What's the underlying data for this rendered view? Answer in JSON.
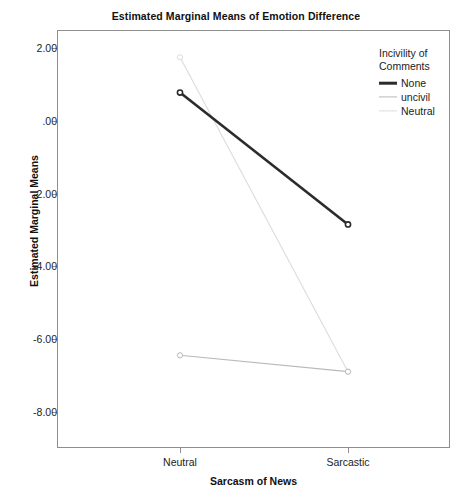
{
  "chart_data": {
    "type": "line",
    "title": "Estimated Marginal Means of Emotion Difference",
    "xlabel": "Sarcasm of News",
    "ylabel": "Estimated Marginal Means",
    "categories": [
      "Neutral",
      "Sarcastic"
    ],
    "ylim": [
      -9.0,
      2.5
    ],
    "yticks": [
      2.0,
      0.0,
      -2.0,
      -4.0,
      -6.0,
      -8.0
    ],
    "ytick_labels": [
      "2.00",
      ".00",
      "-2.00",
      "-4.00",
      "-6.00",
      "-8.00"
    ],
    "grid": false,
    "legend_position": "right",
    "legend_title": "Incivility of Comments",
    "markers": "open-circle",
    "series": [
      {
        "name": "None",
        "values": [
          0.78,
          -2.85
        ],
        "color": "#2b2b2b",
        "width": 2.6
      },
      {
        "name": "uncivil",
        "values": [
          -6.45,
          -6.9
        ],
        "color": "#b9b9b9",
        "width": 1.1
      },
      {
        "name": "Neutral",
        "values": [
          1.75,
          -6.9
        ],
        "color": "#dcdcdc",
        "width": 1.1
      }
    ]
  },
  "chart": {
    "title": "Estimated Marginal Means of Emotion Difference",
    "y_axis_title": "Estimated Marginal Means",
    "x_axis_title": "Sarcasm of News",
    "y_ticks": [
      "2.00",
      ".00",
      "-2.00",
      "-4.00",
      "-6.00",
      "-8.00"
    ],
    "x_ticks": [
      "Neutral",
      "Sarcastic"
    ]
  },
  "legend": {
    "title_line1": "Incivility of",
    "title_line2": "Comments",
    "items": [
      {
        "label": "None",
        "color": "#2b2b2b"
      },
      {
        "label": "uncivil",
        "color": "#b9b9b9"
      },
      {
        "label": "Neutral",
        "color": "#dcdcdc"
      }
    ]
  }
}
